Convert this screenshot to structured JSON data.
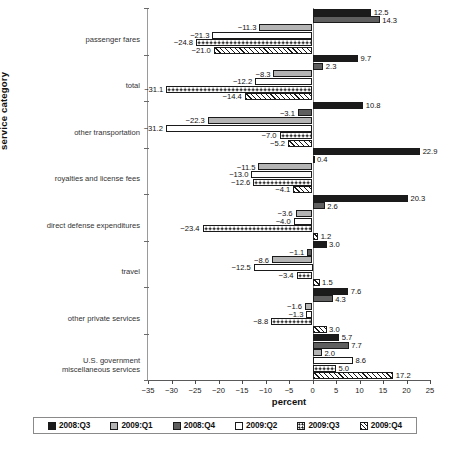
{
  "chart_data": {
    "type": "bar",
    "orientation": "horizontal-grouped",
    "title": "",
    "xlabel": "percent",
    "ylabel": "service category",
    "xlim": [
      -35,
      25
    ],
    "xticks": [
      "-35",
      "-30",
      "-25",
      "-20",
      "-15",
      "-10",
      "-5",
      "0",
      "5",
      "10",
      "15",
      "20",
      "25"
    ],
    "xtick_values": [
      -35,
      -30,
      -25,
      -20,
      -15,
      -10,
      -5,
      0,
      5,
      10,
      15,
      20,
      25
    ],
    "grid": false,
    "legend_position": "bottom",
    "categories": [
      "passenger fares",
      "total",
      "other transportation",
      "royalties and license fees",
      "direct defense expenditures",
      "travel",
      "other private services",
      "U.S. government\nmiscellaneous services"
    ],
    "series": [
      {
        "name": "2008:Q3",
        "style": "black",
        "values": [
          12.5,
          9.7,
          10.8,
          22.9,
          20.3,
          3.0,
          7.6,
          5.7
        ]
      },
      {
        "name": "2008:Q4",
        "style": "dark-gray",
        "values": [
          14.3,
          2.3,
          -3.1,
          0.4,
          2.6,
          -1.1,
          4.3,
          7.7
        ]
      },
      {
        "name": "2009:Q1",
        "style": "light-gray",
        "values": [
          -11.3,
          -8.3,
          -22.3,
          -11.5,
          -3.6,
          -8.6,
          -1.6,
          2.0
        ]
      },
      {
        "name": "2009:Q2",
        "style": "white",
        "values": [
          -21.3,
          -12.2,
          -31.2,
          -13.0,
          -4.0,
          -12.5,
          -1.3,
          8.6
        ]
      },
      {
        "name": "2009:Q3",
        "style": "dotted",
        "values": [
          -24.8,
          -31.1,
          -7.0,
          -12.6,
          -23.4,
          -3.4,
          -8.8,
          5.0
        ]
      },
      {
        "name": "2009:Q4",
        "style": "hatched",
        "values": [
          -21.0,
          -14.4,
          -5.2,
          -4.1,
          1.2,
          1.5,
          3.0,
          17.2
        ]
      }
    ],
    "value_labels": [
      [
        "12.5",
        "14.3",
        "-11.3",
        "-21.3",
        "-24.8",
        "-21.0"
      ],
      [
        "9.7",
        "2.3",
        "-8.3",
        "-12.2",
        "-31.1",
        "-14.4"
      ],
      [
        "10.8",
        "-3.1",
        "-22.3",
        "-31.2",
        "-7.0",
        "-5.2"
      ],
      [
        "22.9",
        "0.4",
        "-11.5",
        "-13.0",
        "-12.6",
        "-4.1"
      ],
      [
        "20.3",
        "2.6",
        "-3.6",
        "-4.0",
        "-23.4",
        "1.2"
      ],
      [
        "3.0",
        "-1.1",
        "-8.6",
        "-12.5",
        "-3.4",
        "1.5"
      ],
      [
        "7.6",
        "4.3",
        "-1.6",
        "-1.3",
        "-8.8",
        "3.0"
      ],
      [
        "5.7",
        "7.7",
        "2.0",
        "8.6",
        "5.0",
        "17.2"
      ]
    ]
  },
  "legend": {
    "items": [
      {
        "label": "2008:Q3",
        "swatch": "sw0"
      },
      {
        "label": "2009:Q1",
        "swatch": "sw1"
      },
      {
        "label": "2008:Q4",
        "swatch": "sw2"
      },
      {
        "label": "2009:Q2",
        "swatch": "sw3"
      },
      {
        "label": "2009:Q3",
        "swatch": "sw4"
      },
      {
        "label": "2009:Q4",
        "swatch": "sw5"
      }
    ]
  }
}
